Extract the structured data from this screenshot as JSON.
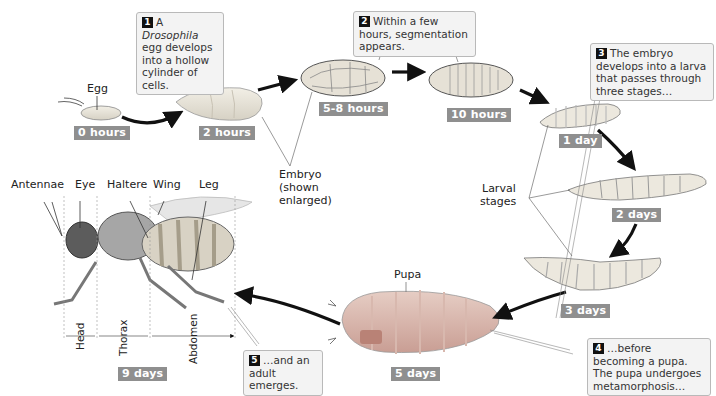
{
  "diagram": {
    "colors": {
      "badge_bg": "#8f8f8f",
      "badge_text": "#ffffff",
      "callout_bg": "#f3f3f3",
      "callout_border": "#b9b9b9",
      "number_bg": "#111111",
      "arrow": "#111111",
      "organism_fill": "#e8e4dc",
      "pupa_fill": "#d9b8b0"
    },
    "stages": [
      {
        "id": "egg",
        "label": "Egg",
        "time": "0 hours"
      },
      {
        "id": "embryo-2h",
        "time": "2 hours"
      },
      {
        "id": "embryo-5-8h",
        "time": "5-8 hours"
      },
      {
        "id": "embryo-10h",
        "time": "10 hours"
      },
      {
        "id": "larva-1",
        "time": "1 day"
      },
      {
        "id": "larva-2",
        "time": "2 days"
      },
      {
        "id": "larva-3",
        "time": "3 days"
      },
      {
        "id": "pupa",
        "label": "Pupa",
        "time": "5 days"
      },
      {
        "id": "adult",
        "time": "9 days"
      }
    ],
    "callouts": [
      {
        "num": "1",
        "text_pre": "A ",
        "text_italic": "Drosophila",
        "text_post": " egg develops into a hollow cylinder of cells."
      },
      {
        "num": "2",
        "text": "Within a few hours, segmentation appears."
      },
      {
        "num": "3",
        "text": "The embryo develops into a larva that passes through three stages…"
      },
      {
        "num": "4",
        "text": "…before becoming a pupa. The pupa undergoes metamorphosis…"
      },
      {
        "num": "5",
        "text": "…and an adult emerges."
      }
    ],
    "labels": {
      "embryo": "Embryo (shown enlarged)",
      "embryo_l1": "Embryo",
      "embryo_l2": "(shown",
      "embryo_l3": "enlarged)",
      "larval_l1": "Larval",
      "larval_l2": "stages"
    },
    "adult_parts": {
      "antennae": "Antennae",
      "eye": "Eye",
      "haltere": "Haltere",
      "wing": "Wing",
      "leg": "Leg",
      "head": "Head",
      "thorax": "Thorax",
      "abdomen": "Abdomen"
    }
  }
}
